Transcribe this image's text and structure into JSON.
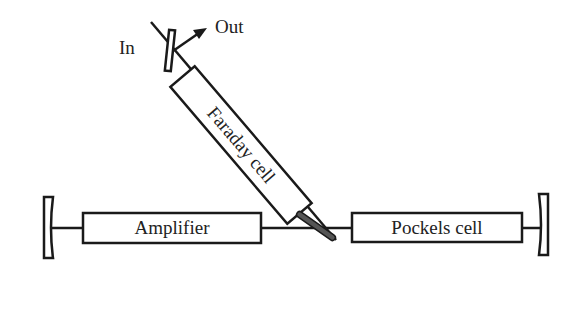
{
  "diagram": {
    "colors": {
      "stroke": "#1a1a1a",
      "fill": "#ffffff",
      "text": "#222222"
    },
    "components": {
      "amplifier": {
        "label": "Amplifier"
      },
      "pockels_cell": {
        "label": "Pockels cell"
      },
      "faraday_cell": {
        "label": "Faraday cell"
      },
      "input": {
        "label": "In"
      },
      "output": {
        "label": "Out"
      }
    }
  }
}
